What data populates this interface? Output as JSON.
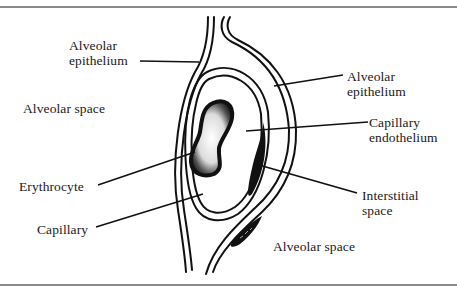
{
  "figure": {
    "type": "histology-schematic",
    "labels": {
      "alveolar_epithelium_left": [
        "Alveolar",
        "epithelium"
      ],
      "alveolar_space_left": "Alveolar space",
      "erythrocyte": "Erythrocyte",
      "capillary": "Capillary",
      "alveolar_epithelium_right": [
        "Alveolar",
        "epithelium"
      ],
      "capillary_endothelium": [
        "Capillary",
        "endothelium"
      ],
      "interstitial_space": [
        "Interstitial",
        "space"
      ],
      "alveolar_space_right": "Alveolar space"
    }
  },
  "colors": {
    "ink": "#111111",
    "text": "#1a1a1a",
    "frame": "#8a8a8a",
    "background": "#ffffff"
  }
}
